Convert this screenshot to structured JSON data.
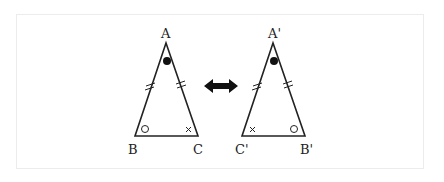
{
  "diagram": {
    "left_triangle": {
      "vertices": [
        {
          "label": "A",
          "x": 166,
          "y": 43
        },
        {
          "label": "B",
          "x": 135,
          "y": 136
        },
        {
          "label": "C",
          "x": 198,
          "y": 136
        }
      ],
      "angle_marks": {
        "A": "filled-dot",
        "B": "circle",
        "C": "cross"
      },
      "equal_side_marks": [
        "AB",
        "AC"
      ]
    },
    "right_triangle": {
      "vertices": [
        {
          "label": "A'",
          "x": 273,
          "y": 43
        },
        {
          "label": "C'",
          "x": 242,
          "y": 136
        },
        {
          "label": "B'",
          "x": 305,
          "y": 136
        }
      ],
      "angle_marks": {
        "A'": "filled-dot",
        "C'": "cross",
        "B'": "circle"
      },
      "equal_side_marks": [
        "A'C'",
        "A'B'"
      ]
    },
    "arrow": {
      "type": "double-headed",
      "color": "#111111"
    },
    "labels": {
      "A": "A",
      "B": "B",
      "C": "C",
      "A2": "A'",
      "B2": "B'",
      "C2": "C'"
    },
    "colors": {
      "stroke": "#222222",
      "frame": "#ececec"
    }
  }
}
